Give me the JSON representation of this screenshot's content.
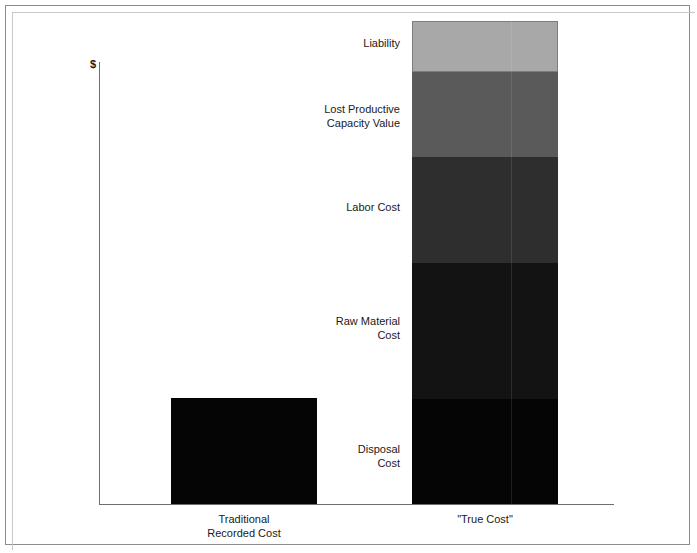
{
  "chart_data": {
    "type": "bar",
    "title": "",
    "subtitle": "",
    "xlabel": "",
    "ylabel": "$",
    "grid": false,
    "legend": "none",
    "stacked": true,
    "categories": [
      "Traditional\nRecorded Cost",
      "\"True Cost\""
    ],
    "series": [
      {
        "name": "Disposal Cost",
        "values": [
          106,
          105
        ],
        "color": "#050505"
      },
      {
        "name": "Raw Material\nCost",
        "values": [
          0,
          136
        ],
        "color": "#131313"
      },
      {
        "name": "Labor Cost",
        "values": [
          0,
          106
        ],
        "color": "#2e2e2e"
      },
      {
        "name": "Lost Productive\nCapacity Value",
        "values": [
          0,
          85
        ],
        "color": "#5a5a5a"
      },
      {
        "name": "Liability",
        "values": [
          0,
          51
        ],
        "color": "#a8a8a8"
      }
    ],
    "totals": [
      106,
      483
    ],
    "ylim": [
      0,
      500
    ],
    "annotations": [
      "Liability",
      "Lost Productive\nCapacity Value",
      "Labor Cost",
      "Raw Material\nCost",
      "Disposal\nCost"
    ]
  },
  "axes": {
    "y_axis_label": "$"
  },
  "bars": {
    "traditional": {
      "category_label": "Traditional\nRecorded Cost",
      "segments": [
        {
          "label": "Disposal Cost",
          "color": "#050505"
        }
      ]
    },
    "true_cost": {
      "category_label": "\"True Cost\"",
      "segments": [
        {
          "label": "Liability",
          "color": "#a8a8a8"
        },
        {
          "label": "Lost Productive\nCapacity Value",
          "color": "#5a5a5a"
        },
        {
          "label": "Labor Cost",
          "color": "#2e2e2e"
        },
        {
          "label": "Raw Material\nCost",
          "color": "#131313"
        },
        {
          "label": "Disposal\nCost",
          "color": "#050505"
        }
      ]
    }
  },
  "colors": {
    "frame": "#8c8c8c",
    "axis": "#6e6e6e",
    "text": "#1a1a1a",
    "background": "#ffffff"
  }
}
